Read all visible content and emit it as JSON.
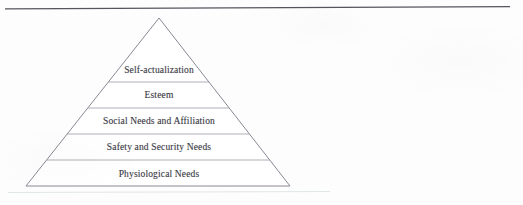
{
  "figure": {
    "name": "maslow-hierarchy-of-needs-pyramid",
    "top_rule": {
      "name": "horizontal-rule",
      "color": "#55555f"
    },
    "pyramid": {
      "outline_color": "#7a7a88",
      "divider_color": "#9a9aa6",
      "fill_color": "#ffffff",
      "apex": {
        "x": 159,
        "y": 18
      },
      "base_left": {
        "x": 26,
        "y": 186
      },
      "base_right": {
        "x": 290,
        "y": 186
      },
      "dividers_y": [
        82,
        108,
        134,
        160
      ],
      "tiers": [
        {
          "label": "Self-actualization",
          "center_x": 159,
          "center_y": 70
        },
        {
          "label": "Esteem",
          "center_x": 159,
          "center_y": 95
        },
        {
          "label": "Social Needs and Affiliation",
          "center_x": 159,
          "center_y": 121
        },
        {
          "label": "Safety and Security Needs",
          "center_x": 159,
          "center_y": 147
        },
        {
          "label": "Physiological Needs",
          "center_x": 159,
          "center_y": 174
        }
      ]
    },
    "artifact_line": {
      "name": "scan-artifact-line",
      "color": "#b9c6c6"
    }
  }
}
